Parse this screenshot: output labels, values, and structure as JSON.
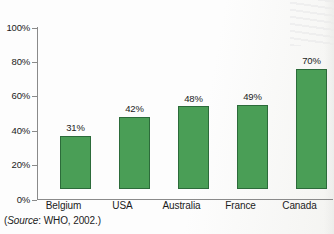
{
  "chart_data": {
    "type": "bar",
    "title": "",
    "subtitle": "",
    "xlabel": "",
    "ylabel": "",
    "categories": [
      "Belgium",
      "USA",
      "Australia",
      "France",
      "Canada"
    ],
    "values": [
      31,
      42,
      48,
      49,
      70
    ],
    "value_labels": [
      "31%",
      "42%",
      "48%",
      "49%",
      "70%"
    ],
    "ylim": [
      0,
      100
    ],
    "y_ticks": [
      0,
      20,
      40,
      60,
      80,
      100
    ],
    "y_tick_labels": [
      "0%",
      "20%",
      "40%",
      "60%",
      "80%",
      "100%"
    ],
    "grid": false,
    "legend": null,
    "series": [
      {
        "name": "",
        "values": [
          31,
          42,
          48,
          49,
          70
        ]
      }
    ],
    "colors": {
      "bar_fill": "#4a9e56",
      "bar_border": "#2c6b3a",
      "axis": "#8a8a8a",
      "text": "#1b1b1b",
      "background": "#fdfdfd"
    }
  },
  "caption": {
    "open_paren": "(",
    "source_word": "Source",
    "source_rest": ": WHO, 2002.)"
  }
}
